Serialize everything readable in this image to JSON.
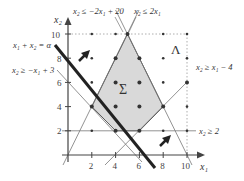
{
  "diagram": {
    "axes": {
      "x_label": "x₁",
      "y_label": "x₂",
      "x_ticks": [
        "2",
        "4",
        "6",
        "8",
        "10"
      ],
      "y_ticks": [
        "2",
        "4",
        "6",
        "8",
        "10"
      ]
    },
    "region_labels": {
      "feasible": "Σ",
      "lattice": "Λ"
    },
    "constraints": {
      "c1": "x₂ ≤ −2x₁ + 20",
      "c2": "x₂ ≤ 2x₁",
      "c3": "x₂ ≥ x₁ − 4",
      "c4": "x₂ ≥ −x₁ + 3",
      "c5": "x₂ ≥ 2"
    },
    "objective_line": "x₁ + x₂ = α",
    "polygon_vertices": [
      [
        2,
        4
      ],
      [
        4,
        2
      ],
      [
        6,
        2
      ],
      [
        8,
        4
      ],
      [
        5,
        10
      ]
    ],
    "colors": {
      "region_fill": "#d9d9d9",
      "line": "#555555",
      "thick_line": "#222222"
    }
  }
}
